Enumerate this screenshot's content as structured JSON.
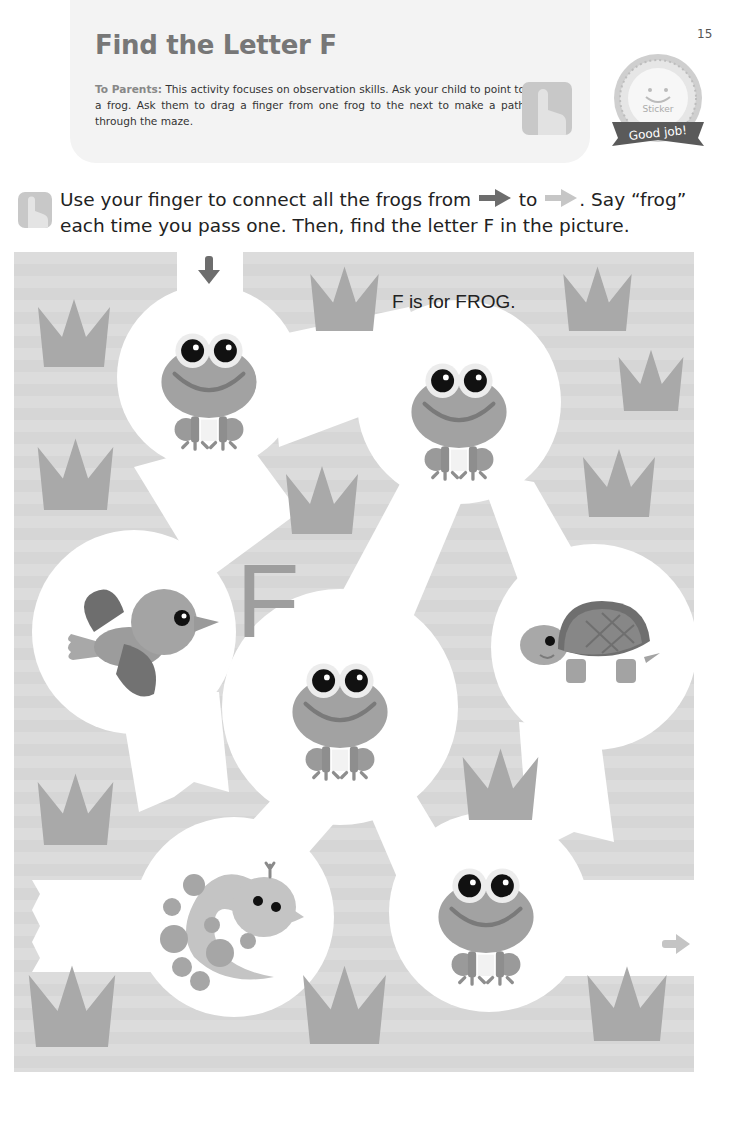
{
  "page": {
    "number": "15"
  },
  "header": {
    "title": "Find the Letter F",
    "parents_label": "To Parents:",
    "parents_text": " This activity focuses on observation skills. Ask your child to point to a frog. Ask them to drag a finger from one frog to the next to make a path through the maze."
  },
  "sticker": {
    "label": "Sticker",
    "banner": "Good job!"
  },
  "instructions": {
    "part1": "Use your finger to connect all the frogs from ",
    "part2": " to ",
    "part3": ". Say “frog” each time you pass one. Then, find the letter F in the picture."
  },
  "maze": {
    "caption": "F is for FROG.",
    "hidden_letter": "F",
    "start_icon": "arrow-down-icon",
    "end_icon": "arrow-right-icon",
    "animals": [
      "frog",
      "frog",
      "bird",
      "frog",
      "turtle",
      "snake",
      "frog"
    ]
  },
  "colors": {
    "background": "#dcdcdc",
    "path": "#ffffff",
    "grass": "#a9a9a9",
    "frog_body": "#a0a0a0",
    "start_arrow": "#6d6d6d",
    "end_arrow": "#c4c4c4"
  }
}
